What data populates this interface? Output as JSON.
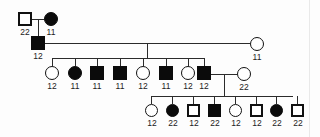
{
  "diagram": {
    "kind": "pedigree-chart",
    "legend": {
      "filled_meaning": "affected",
      "unfilled_meaning": "unaffected",
      "square_meaning": "male",
      "circle_meaning": "female"
    },
    "colors": {
      "symbol_stroke": "#111111",
      "symbol_fill_affected": "#0b0b0b",
      "symbol_fill_unaffected": "#ffffff",
      "line": "#2b2b2b",
      "label_text": "#222222",
      "background": "#fdfdfd"
    },
    "generations": [
      {
        "id": "generation-1",
        "label": "I",
        "individuals": [
          {
            "id": "I-1",
            "shape": "square",
            "affected": false,
            "genotype": "22",
            "x": 18,
            "y": 12,
            "size": 14
          },
          {
            "id": "I-2",
            "shape": "circle",
            "affected": true,
            "genotype": "11",
            "x": 44,
            "y": 12,
            "size": 14
          }
        ]
      },
      {
        "id": "generation-2",
        "label": "II",
        "individuals": [
          {
            "id": "II-1",
            "shape": "square",
            "affected": true,
            "genotype": "12",
            "x": 31,
            "y": 36,
            "size": 14
          },
          {
            "id": "II-2",
            "shape": "circle",
            "affected": false,
            "genotype": "11",
            "x": 250,
            "y": 37,
            "size": 14
          }
        ]
      },
      {
        "id": "generation-3",
        "label": "III",
        "individuals": [
          {
            "id": "III-1",
            "shape": "circle",
            "affected": false,
            "genotype": "12",
            "x": 45,
            "y": 66,
            "size": 14
          },
          {
            "id": "III-2",
            "shape": "circle",
            "affected": true,
            "genotype": "11",
            "x": 68,
            "y": 66,
            "size": 14
          },
          {
            "id": "III-3",
            "shape": "square",
            "affected": true,
            "genotype": "11",
            "x": 90,
            "y": 66,
            "size": 14
          },
          {
            "id": "III-4",
            "shape": "square",
            "affected": true,
            "genotype": "11",
            "x": 113,
            "y": 66,
            "size": 14
          },
          {
            "id": "III-5",
            "shape": "circle",
            "affected": false,
            "genotype": "12",
            "x": 136,
            "y": 66,
            "size": 14
          },
          {
            "id": "III-6",
            "shape": "square",
            "affected": true,
            "genotype": "11",
            "x": 159,
            "y": 66,
            "size": 14
          },
          {
            "id": "III-7",
            "shape": "circle",
            "affected": false,
            "genotype": "12",
            "x": 181,
            "y": 66,
            "size": 14
          },
          {
            "id": "III-8",
            "shape": "square",
            "affected": true,
            "genotype": "12",
            "x": 197,
            "y": 66,
            "size": 14
          },
          {
            "id": "III-9",
            "shape": "circle",
            "affected": false,
            "genotype": "22",
            "x": 237,
            "y": 67,
            "size": 14
          }
        ]
      },
      {
        "id": "generation-4",
        "label": "IV",
        "individuals": [
          {
            "id": "IV-1",
            "shape": "circle",
            "affected": false,
            "genotype": "12",
            "x": 145,
            "y": 104,
            "size": 13
          },
          {
            "id": "IV-2",
            "shape": "circle",
            "affected": true,
            "genotype": "22",
            "x": 166,
            "y": 104,
            "size": 13
          },
          {
            "id": "IV-3",
            "shape": "square",
            "affected": false,
            "genotype": "12",
            "x": 187,
            "y": 104,
            "size": 13
          },
          {
            "id": "IV-4",
            "shape": "square",
            "affected": true,
            "genotype": "22",
            "x": 208,
            "y": 104,
            "size": 13
          },
          {
            "id": "IV-5",
            "shape": "circle",
            "affected": false,
            "genotype": "12",
            "x": 229,
            "y": 104,
            "size": 13
          },
          {
            "id": "IV-6",
            "shape": "square",
            "affected": false,
            "genotype": "12",
            "x": 250,
            "y": 104,
            "size": 13
          },
          {
            "id": "IV-7",
            "shape": "circle",
            "affected": true,
            "genotype": "22",
            "x": 270,
            "y": 104,
            "size": 13
          },
          {
            "id": "IV-8",
            "shape": "square",
            "affected": false,
            "genotype": "22",
            "x": 291,
            "y": 104,
            "size": 13
          }
        ]
      }
    ],
    "genotype_labels_flat": [
      "22",
      "11",
      "12",
      "11",
      "12",
      "11",
      "11",
      "11",
      "12",
      "11",
      "12",
      "12",
      "22",
      "12",
      "22",
      "12",
      "22",
      "12",
      "12",
      "22",
      "22"
    ]
  }
}
